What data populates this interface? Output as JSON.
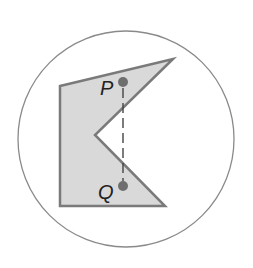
{
  "diagram": {
    "type": "geometry",
    "colors": {
      "background": "#ffffff",
      "circle_stroke": "#8a8a8a",
      "polygon_fill": "#d9d9d9",
      "polygon_stroke": "#7a7a7a",
      "point_fill": "#6e6e6e",
      "dash_stroke": "#444444",
      "label": "#222222"
    },
    "circle": {
      "cx": 126,
      "cy": 139,
      "r": 108
    },
    "polygon": {
      "vertices": [
        [
          60,
          86
        ],
        [
          173,
          59
        ],
        [
          95,
          135
        ],
        [
          165,
          206
        ],
        [
          60,
          206
        ]
      ]
    },
    "points": [
      {
        "name": "P",
        "label": "P",
        "cx": 123,
        "cy": 82,
        "r": 5,
        "label_x": 100,
        "label_y": 78
      },
      {
        "name": "Q",
        "label": "Q",
        "cx": 123,
        "cy": 186,
        "r": 5,
        "label_x": 98,
        "label_y": 182
      }
    ],
    "segment": {
      "from": "P",
      "to": "Q",
      "x1": 123,
      "y1": 88,
      "x2": 123,
      "y2": 181,
      "style": "dashed",
      "dash": "10 5"
    }
  }
}
